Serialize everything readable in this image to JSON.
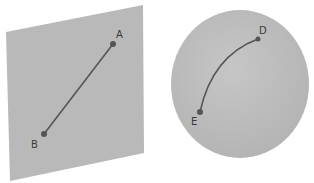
{
  "diagram": {
    "background_color": "#ffffff",
    "panels": [
      {
        "name": "plane",
        "shape": "parallelogram",
        "fill": "#b9b9b9",
        "corners": [
          [
            6,
            32
          ],
          [
            143,
            5
          ],
          [
            144,
            153
          ],
          [
            10,
            181
          ]
        ],
        "path_type": "straight-line",
        "stroke": "#555555",
        "points": [
          {
            "label": "A",
            "x": 113,
            "y": 44,
            "label_x": 116,
            "label_y": 38
          },
          {
            "label": "B",
            "x": 44,
            "y": 134,
            "label_x": 32,
            "label_y": 147
          }
        ]
      },
      {
        "name": "sphere",
        "shape": "circle",
        "fill": "#bcbcbc",
        "cx": 240,
        "cy": 84,
        "rx": 69,
        "ry": 74,
        "path_type": "curved-arc",
        "stroke": "#555555",
        "points": [
          {
            "label": "D",
            "x": 258,
            "y": 39,
            "label_x": 259,
            "label_y": 33
          },
          {
            "label": "E",
            "x": 200,
            "y": 112,
            "label_x": 192,
            "label_y": 124
          }
        ]
      }
    ],
    "labels": {
      "A": "A",
      "B": "B",
      "D": "D",
      "E": "E"
    }
  }
}
